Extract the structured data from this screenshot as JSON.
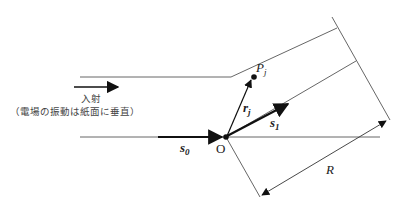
{
  "diagram": {
    "incident_label": "入射",
    "incident_note": "（電場の振動は紙面に垂直）",
    "point_label": "P",
    "point_sub": "j",
    "origin_label": "O",
    "vec_r_label": "r",
    "vec_r_sub": "j",
    "vec_s0_label": "s",
    "vec_s0_sub": "0",
    "vec_s1_label": "s",
    "vec_s1_sub": "1",
    "distance_label": "R",
    "colors": {
      "line": "#555555",
      "vector": "#111111"
    }
  }
}
